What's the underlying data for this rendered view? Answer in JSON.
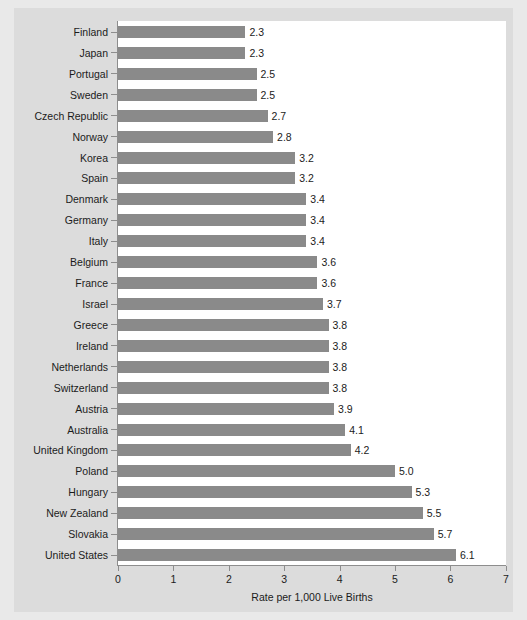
{
  "chart_data": {
    "type": "bar",
    "orientation": "horizontal",
    "title": "",
    "xlabel": "Rate per 1,000 Live Births",
    "ylabel": "",
    "xlim": [
      0,
      7
    ],
    "xticks": [
      "0",
      "1",
      "2",
      "3",
      "4",
      "5",
      "6",
      "7"
    ],
    "grid": false,
    "legend": null,
    "bar_color": "#8a8a8a",
    "plot_background": "#ffffff",
    "figure_background": "#dcdcdc",
    "page_background": "#e9e9e9",
    "text_color": "#1b1b1b",
    "axis_color": "#8d8d8d",
    "value_label_format": "one-decimal",
    "categories": [
      "Finland",
      "Japan",
      "Portugal",
      "Sweden",
      "Czech Republic",
      "Norway",
      "Korea",
      "Spain",
      "Denmark",
      "Germany",
      "Italy",
      "Belgium",
      "France",
      "Israel",
      "Greece",
      "Ireland",
      "Netherlands",
      "Switzerland",
      "Austria",
      "Australia",
      "United Kingdom",
      "Poland",
      "Hungary",
      "New Zealand",
      "Slovakia",
      "United States"
    ],
    "values": [
      2.3,
      2.3,
      2.5,
      2.5,
      2.7,
      2.8,
      3.2,
      3.2,
      3.4,
      3.4,
      3.4,
      3.6,
      3.6,
      3.7,
      3.8,
      3.8,
      3.8,
      3.8,
      3.9,
      4.1,
      4.2,
      5.0,
      5.3,
      5.5,
      5.7,
      6.1
    ],
    "value_labels": [
      "2.3",
      "2.3",
      "2.5",
      "2.5",
      "2.7",
      "2.8",
      "3.2",
      "3.2",
      "3.4",
      "3.4",
      "3.4",
      "3.6",
      "3.6",
      "3.7",
      "3.8",
      "3.8",
      "3.8",
      "3.8",
      "3.9",
      "4.1",
      "4.2",
      "5.0",
      "5.3",
      "5.5",
      "5.7",
      "6.1"
    ]
  }
}
